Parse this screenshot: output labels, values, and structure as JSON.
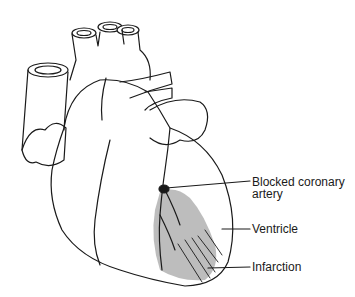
{
  "diagram": {
    "labels": [
      {
        "id": "blocked",
        "line1": "Blocked coronary",
        "line2": "artery"
      },
      {
        "id": "ventricle",
        "line1": "Ventricle"
      },
      {
        "id": "infarction",
        "line1": "Infarction"
      }
    ],
    "colors": {
      "line": "#1a1a1a",
      "infarction_fill": "#bdbdbd",
      "background": "#ffffff"
    }
  }
}
